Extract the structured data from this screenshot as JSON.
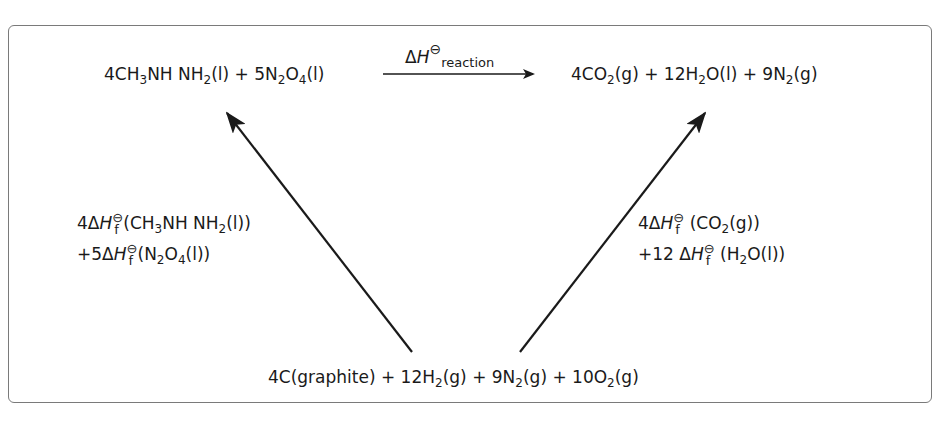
{
  "diagram": {
    "reactants": {
      "parts": [
        "4CH",
        "3",
        "NH NH",
        "2",
        "(l) + 5N",
        "2",
        "O",
        "4",
        "(l)"
      ],
      "plain": "4CH3NH NH2(l) + 5N2O4(l)"
    },
    "products": {
      "parts": [
        "4CO",
        "2",
        "(g) + 12H",
        "2",
        "O(l) + 9N",
        "2",
        "(g)"
      ],
      "plain": "4CO2(g) + 12H2O(l) + 9N2(g)"
    },
    "elements": {
      "parts": [
        "4C(graphite) + 12H",
        "2",
        "(g) + 9N",
        "2",
        "(g) + 10O",
        "2",
        "(g)"
      ],
      "plain": "4C(graphite) + 12H2(g) + 9N2(g) + 10O2(g)"
    },
    "reaction_arrow": {
      "delta": "Δ",
      "H": "H",
      "standard": "⊖",
      "subscript": "reaction",
      "plain": "ΔH⊖reaction"
    },
    "left_label": {
      "line1": {
        "coef": "4Δ",
        "H": "H",
        "standard": "⊖",
        "f": "f",
        "species_parts": [
          "(CH",
          "3",
          "NH NH",
          "2",
          "(l))"
        ]
      },
      "line2": {
        "coef": "+5Δ",
        "H": "H",
        "standard": "⊖",
        "f": "f",
        "species_parts": [
          "(N",
          "2",
          "O",
          "4",
          "(l))"
        ]
      },
      "plain": "4ΔHf⊖(CH3NH NH2(l)) +5ΔHf⊖(N2O4(l))"
    },
    "right_label": {
      "line1": {
        "coef": "4Δ",
        "H": "H",
        "standard": "⊖",
        "f": "f",
        "species_parts": [
          " (CO",
          "2",
          "(g))"
        ]
      },
      "line2": {
        "coef": "+12 Δ",
        "H": "H",
        "standard": "⊖",
        "f": "f",
        "species_parts": [
          " (H",
          "2",
          "O(l))"
        ]
      },
      "plain": "4ΔHf⊖ (CO2(g)) +12 ΔHf⊖ (H2O(l))"
    },
    "colors": {
      "frame": "#7a7a7a",
      "ink": "#1a1a1a",
      "background": "#ffffff"
    }
  }
}
